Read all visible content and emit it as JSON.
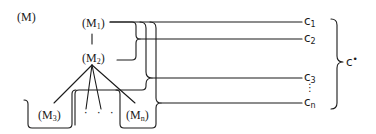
{
  "diagram": {
    "title": "(M)",
    "nodes": [
      {
        "id": "M1",
        "prefix": "(M",
        "sub": "1",
        "suffix": ")"
      },
      {
        "id": "M2",
        "prefix": "(M",
        "sub": "2",
        "suffix": ")"
      },
      {
        "id": "M3",
        "prefix": "(M",
        "sub": "3",
        "suffix": ")"
      },
      {
        "id": "Mn",
        "prefix": "(M",
        "sub": "n",
        "suffix": ")"
      }
    ],
    "ellipsis_nodes": "· · ·",
    "edges": [
      {
        "from": "M1",
        "to": "M2"
      },
      {
        "from": "M2",
        "to": "M3"
      },
      {
        "from": "M2",
        "to": "..."
      },
      {
        "from": "M2",
        "to": "Mn"
      }
    ],
    "outputs": [
      {
        "id": "c1",
        "base": "c",
        "sub": "1"
      },
      {
        "id": "c2",
        "base": "c",
        "sub": "2"
      },
      {
        "id": "c3",
        "base": "c",
        "sub": "3"
      },
      {
        "id": "cn",
        "base": "c",
        "sub": "n"
      }
    ],
    "outputs_ellipsis": "⋮",
    "group_label": {
      "base": "c",
      "sup": "•"
    },
    "stroke_color": "#1a1a1a"
  }
}
